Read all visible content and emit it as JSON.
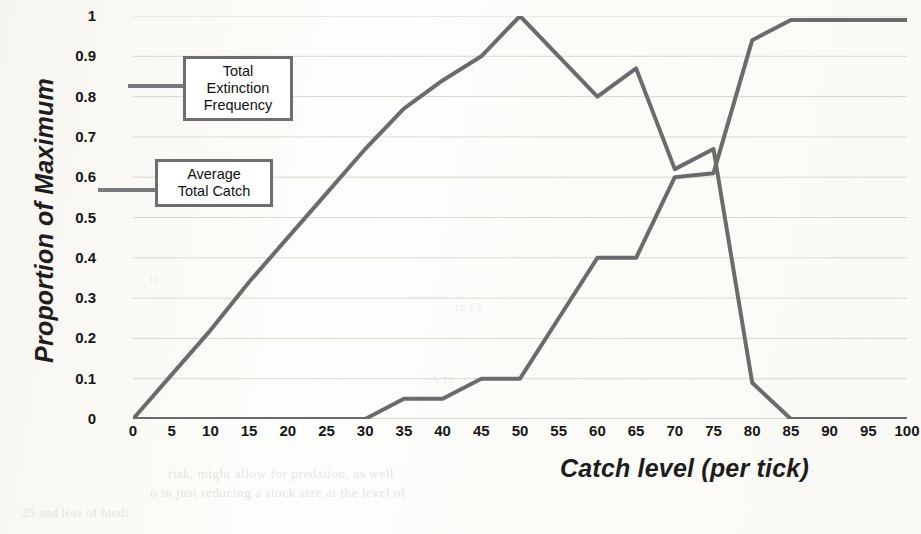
{
  "figure": {
    "axis_title_x": "Catch level (per tick)",
    "axis_title_y": "Proportion of Maximum",
    "line_color": "#6b6b6b",
    "grid_color": "#d9d7cf",
    "callouts": [
      {
        "id": "extinction",
        "label": "Total\nExtinction\nFrequency"
      },
      {
        "id": "catch",
        "label": "Average\nTotal Catch"
      }
    ]
  },
  "callout_extinction_line1": "Total",
  "callout_extinction_line2": "Extinction",
  "callout_extinction_line3": "Frequency",
  "callout_catch_line1": "Average",
  "callout_catch_line2": "Total Catch",
  "bleed_through": {
    "l1": "risk, might allow for predation, as well",
    "l2": "o in just reducing a stock size at the level of",
    "l3": "25 and loss of biodi",
    "l4": "in (3",
    "l5": "A fe",
    "l6": "ti"
  },
  "chart_data": {
    "type": "line",
    "title": "",
    "xlabel": "Catch level (per tick)",
    "ylabel": "Proportion of Maximum",
    "xlim": [
      0,
      100
    ],
    "ylim": [
      0,
      1
    ],
    "xticks": [
      0,
      5,
      10,
      15,
      20,
      25,
      30,
      35,
      40,
      45,
      50,
      55,
      60,
      65,
      70,
      75,
      80,
      85,
      90,
      95,
      100
    ],
    "yticks": [
      0,
      0.1,
      0.2,
      0.3,
      0.4,
      0.5,
      0.6,
      0.7,
      0.8,
      0.9,
      1
    ],
    "xtick_labels": [
      "0",
      "5",
      "10",
      "15",
      "20",
      "25",
      "30",
      "35",
      "40",
      "45",
      "50",
      "55",
      "60",
      "65",
      "70",
      "75",
      "80",
      "85",
      "90",
      "95",
      "100"
    ],
    "ytick_labels": [
      "0",
      "0.1",
      "0.2",
      "0.3",
      "0.4",
      "0.5",
      "0.6",
      "0.7",
      "0.8",
      "0.9",
      "1"
    ],
    "grid": true,
    "grid_axis": "y",
    "legend": "inline-callout-boxes",
    "x": [
      0,
      5,
      10,
      15,
      20,
      25,
      30,
      35,
      40,
      45,
      50,
      55,
      60,
      65,
      70,
      75,
      80,
      85,
      90,
      95,
      100
    ],
    "series": [
      {
        "name": "Total Extinction Frequency",
        "color": "#6b6b6b",
        "values": [
          0,
          0.11,
          0.22,
          0.34,
          0.45,
          0.56,
          0.67,
          0.77,
          0.84,
          0.9,
          1.0,
          0.9,
          0.8,
          0.87,
          0.62,
          0.67,
          0.09,
          0,
          0,
          0,
          0
        ]
      },
      {
        "name": "Average Total Catch",
        "color": "#6b6b6b",
        "values": [
          0,
          0,
          0,
          0,
          0,
          0,
          0,
          0.05,
          0.05,
          0.1,
          0.1,
          0.25,
          0.4,
          0.4,
          0.6,
          0.61,
          0.94,
          0.99,
          0.99,
          0.99,
          0.99
        ]
      }
    ]
  }
}
